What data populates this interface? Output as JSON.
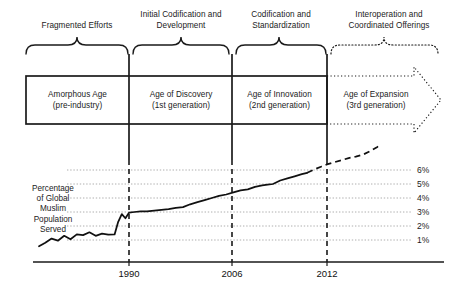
{
  "figure": {
    "title_absent": true,
    "phases": [
      {
        "id": "fragmented",
        "label": "Fragmented Efforts",
        "brace_style": "solid"
      },
      {
        "id": "initial-codification",
        "label": "Initial Codification and\nDevelopment",
        "brace_style": "solid"
      },
      {
        "id": "codification-standardization",
        "label": "Codification and\nStandardization",
        "brace_style": "solid"
      },
      {
        "id": "interoperation",
        "label": "Interoperation and\nCoordinated Offerings",
        "brace_style": "dotted"
      }
    ],
    "phase_lines": [
      {
        "id": "fragmented",
        "line1": "Fragmented Efforts",
        "line2": ""
      },
      {
        "id": "initial-codification",
        "line1": "Initial Codification and",
        "line2": "Development"
      },
      {
        "id": "codification-standardization",
        "line1": "Codification and",
        "line2": "Standardization"
      },
      {
        "id": "interoperation",
        "line1": "Interoperation and",
        "line2": "Coordinated Offerings"
      }
    ],
    "eras": [
      {
        "id": "amorphous",
        "name": "Amorphous Age",
        "generation": "(pre-industry)",
        "border": "solid"
      },
      {
        "id": "discovery",
        "name": "Age of Discovery",
        "generation": "(1st generation)",
        "border": "solid"
      },
      {
        "id": "innovation",
        "name": "Age of Innovation",
        "generation": "(2nd generation)",
        "border": "solid"
      },
      {
        "id": "expansion",
        "name": "Age of Expansion",
        "generation": "(3rd generation)",
        "border": "dotted-arrow"
      }
    ]
  },
  "chart_data": {
    "type": "line",
    "title": "",
    "xlabel": "",
    "ylabel": "Percentage of Global Muslim Population Served",
    "ylabel_lines": [
      "Percentage",
      "of Global",
      "Muslim",
      "Population",
      "Served"
    ],
    "grid": true,
    "legend_position": "none",
    "ylim": [
      0,
      7
    ],
    "y_ticks": [
      1,
      2,
      3,
      4,
      5,
      6
    ],
    "y_tick_labels": [
      "1%",
      "2%",
      "3%",
      "4%",
      "5%",
      "6%"
    ],
    "xlim": [
      1980,
      2018
    ],
    "x_ticks": [
      1990,
      2006,
      2012
    ],
    "x_tick_labels": [
      "1990",
      "2006",
      "2012"
    ],
    "series": [
      {
        "name": "Actual (historical)",
        "style": "solid",
        "x": [
          1980.0,
          1980.7,
          1981.4,
          1982.1,
          1982.8,
          1983.5,
          1984.2,
          1984.9,
          1985.6,
          1986.3,
          1987.0,
          1987.7,
          1988.4,
          1988.8,
          1989.2,
          1989.6,
          1990.0,
          1990.6,
          1991.3,
          1992.0,
          1992.8,
          1993.6,
          1994.4,
          1995.2,
          1996.0,
          1996.8,
          1997.6,
          1998.4,
          1999.2,
          2000.0,
          2000.8,
          2001.6,
          2002.4,
          2003.2,
          2004.0,
          2004.8,
          2005.4,
          2006.0,
          2006.8,
          2007.6,
          2008.4,
          2009.2,
          2009.8
        ],
        "y": [
          0.55,
          0.8,
          1.1,
          0.95,
          1.3,
          1.05,
          1.4,
          1.35,
          1.55,
          1.3,
          1.45,
          1.38,
          1.4,
          2.3,
          2.85,
          2.55,
          2.95,
          3.0,
          3.05,
          3.05,
          3.1,
          3.15,
          3.2,
          3.3,
          3.35,
          3.55,
          3.7,
          3.85,
          4.0,
          4.15,
          4.25,
          4.4,
          4.55,
          4.62,
          4.8,
          4.9,
          4.95,
          5.0,
          5.25,
          5.4,
          5.55,
          5.7,
          5.8
        ]
      },
      {
        "name": "Projected (forecast)",
        "style": "dashed",
        "x": [
          2009.8,
          2010.6,
          2011.4,
          2012.0,
          2012.8,
          2013.6,
          2014.4,
          2015.2,
          2016.0,
          2016.8,
          2017.6,
          2018.0
        ],
        "y": [
          5.8,
          6.05,
          6.25,
          6.4,
          6.55,
          6.7,
          6.85,
          6.95,
          7.1,
          7.35,
          7.65,
          7.85
        ]
      }
    ],
    "vertical_markers": [
      {
        "label": "1990",
        "x": 1990
      },
      {
        "label": "2006",
        "x": 2006
      },
      {
        "label": "2012",
        "x": 2012
      }
    ]
  },
  "colors": {
    "ink": "#1a1a1a",
    "line": "#000000",
    "grid": "#9a9a9a",
    "background": "#ffffff"
  }
}
